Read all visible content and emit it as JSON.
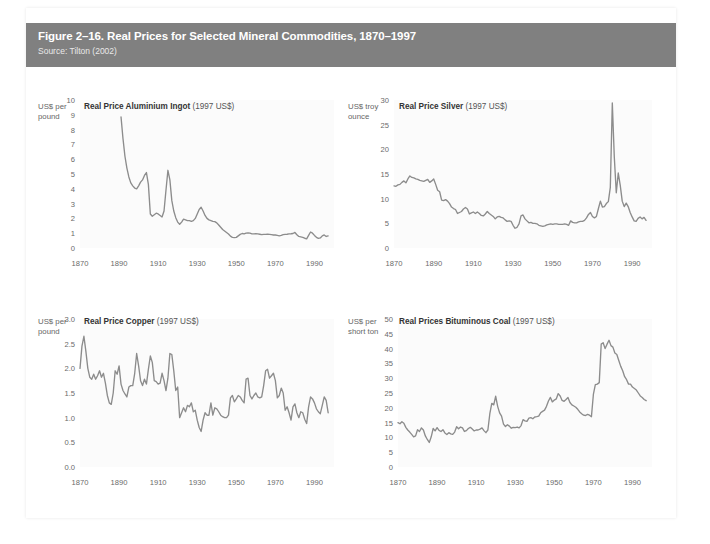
{
  "figure": {
    "title": "Figure 2–16. Real Prices for Selected Mineral Commodities, 1870–1997",
    "source": "Source: Tilton (2002)",
    "header_bg": "#808080",
    "header_text_color": "#ffffff",
    "line_color": "#8c8c8c",
    "plot_bg": "#fbfbfb"
  },
  "chart_data": [
    {
      "type": "line",
      "id": "aluminium",
      "title_bold": "Real Price Aluminium Ingot",
      "title_rest": " (1997 US$)",
      "unit_label": "US$ per\npound",
      "unit_line1": "US$ per",
      "unit_line2": "pound",
      "xlabel": "",
      "ylabel": "US$ per pound",
      "xlim": [
        1870,
        2000
      ],
      "ylim": [
        0,
        10
      ],
      "xticks": [
        1870,
        1890,
        1910,
        1930,
        1950,
        1970,
        1990
      ],
      "yticks": [
        0,
        1,
        2,
        3,
        4,
        5,
        6,
        7,
        8,
        9,
        10
      ],
      "grid": false,
      "legend": "none",
      "x": [
        1891,
        1892,
        1893,
        1894,
        1895,
        1896,
        1897,
        1898,
        1899,
        1900,
        1901,
        1902,
        1903,
        1904,
        1905,
        1906,
        1907,
        1908,
        1909,
        1910,
        1911,
        1912,
        1913,
        1914,
        1915,
        1916,
        1917,
        1918,
        1919,
        1920,
        1921,
        1922,
        1923,
        1924,
        1925,
        1926,
        1927,
        1928,
        1929,
        1930,
        1931,
        1932,
        1933,
        1934,
        1935,
        1936,
        1937,
        1938,
        1939,
        1940,
        1941,
        1942,
        1943,
        1944,
        1945,
        1946,
        1947,
        1948,
        1949,
        1950,
        1951,
        1952,
        1953,
        1954,
        1955,
        1956,
        1957,
        1958,
        1959,
        1960,
        1961,
        1962,
        1963,
        1964,
        1965,
        1966,
        1967,
        1968,
        1969,
        1970,
        1971,
        1972,
        1973,
        1974,
        1975,
        1976,
        1977,
        1978,
        1979,
        1980,
        1981,
        1982,
        1983,
        1984,
        1985,
        1986,
        1987,
        1988,
        1989,
        1990,
        1991,
        1992,
        1993,
        1994,
        1995,
        1996,
        1997
      ],
      "values": [
        8.85,
        7.4,
        6.2,
        5.4,
        4.8,
        4.4,
        4.2,
        4.05,
        4.0,
        4.2,
        4.45,
        4.6,
        4.9,
        5.1,
        4.3,
        2.3,
        2.15,
        2.25,
        2.35,
        2.3,
        2.2,
        2.1,
        2.5,
        3.9,
        5.25,
        4.6,
        3.2,
        2.5,
        2.05,
        1.75,
        1.6,
        1.75,
        1.95,
        1.9,
        1.85,
        1.85,
        1.8,
        1.85,
        2.0,
        2.3,
        2.6,
        2.75,
        2.5,
        2.2,
        2.0,
        1.9,
        1.85,
        1.8,
        1.78,
        1.7,
        1.55,
        1.4,
        1.25,
        1.15,
        1.05,
        0.95,
        0.8,
        0.72,
        0.7,
        0.72,
        0.82,
        0.92,
        0.98,
        0.95,
        1.0,
        1.02,
        1.0,
        0.95,
        0.95,
        0.96,
        0.95,
        0.93,
        0.9,
        0.92,
        0.92,
        0.93,
        0.92,
        0.9,
        0.88,
        0.88,
        0.85,
        0.82,
        0.85,
        0.9,
        0.92,
        0.93,
        0.95,
        0.96,
        0.98,
        1.05,
        0.9,
        0.78,
        0.75,
        0.72,
        0.66,
        0.62,
        0.85,
        1.08,
        1.0,
        0.85,
        0.72,
        0.65,
        0.68,
        0.82,
        0.88,
        0.78,
        0.82
      ]
    },
    {
      "type": "line",
      "id": "silver",
      "title_bold": "Real Price Silver",
      "title_rest": " (1997 US$)",
      "unit_line1": "US$ troy",
      "unit_line2": "ounce",
      "xlabel": "",
      "ylabel": "US$ troy ounce",
      "xlim": [
        1870,
        2000
      ],
      "ylim": [
        0,
        30
      ],
      "xticks": [
        1870,
        1890,
        1910,
        1930,
        1950,
        1970,
        1990
      ],
      "yticks": [
        0,
        5,
        10,
        15,
        20,
        25,
        30
      ],
      "grid": false,
      "legend": "none",
      "x": [
        1870,
        1871,
        1872,
        1873,
        1874,
        1875,
        1876,
        1877,
        1878,
        1879,
        1880,
        1881,
        1882,
        1883,
        1884,
        1885,
        1886,
        1887,
        1888,
        1889,
        1890,
        1891,
        1892,
        1893,
        1894,
        1895,
        1896,
        1897,
        1898,
        1899,
        1900,
        1901,
        1902,
        1903,
        1904,
        1905,
        1906,
        1907,
        1908,
        1909,
        1910,
        1911,
        1912,
        1913,
        1914,
        1915,
        1916,
        1917,
        1918,
        1919,
        1920,
        1921,
        1922,
        1923,
        1924,
        1925,
        1926,
        1927,
        1928,
        1929,
        1930,
        1931,
        1932,
        1933,
        1934,
        1935,
        1936,
        1937,
        1938,
        1939,
        1940,
        1941,
        1942,
        1943,
        1944,
        1945,
        1946,
        1947,
        1948,
        1949,
        1950,
        1951,
        1952,
        1953,
        1954,
        1955,
        1956,
        1957,
        1958,
        1959,
        1960,
        1961,
        1962,
        1963,
        1964,
        1965,
        1966,
        1967,
        1968,
        1969,
        1970,
        1971,
        1972,
        1973,
        1974,
        1975,
        1976,
        1977,
        1978,
        1979,
        1980,
        1981,
        1982,
        1983,
        1984,
        1985,
        1986,
        1987,
        1988,
        1989,
        1990,
        1991,
        1992,
        1993,
        1994,
        1995,
        1996,
        1997
      ],
      "values": [
        12.6,
        12.5,
        12.8,
        12.9,
        13.3,
        13.6,
        13.2,
        14.0,
        14.6,
        14.3,
        14.2,
        14.0,
        13.9,
        13.7,
        13.6,
        13.5,
        13.7,
        13.9,
        13.3,
        13.6,
        14.0,
        12.9,
        11.7,
        11.4,
        9.7,
        9.6,
        9.8,
        9.5,
        9.0,
        8.3,
        8.0,
        7.8,
        7.0,
        7.2,
        7.4,
        7.9,
        8.2,
        7.9,
        6.9,
        7.1,
        7.3,
        7.0,
        7.3,
        7.0,
        6.6,
        6.5,
        6.9,
        7.4,
        7.0,
        6.7,
        6.4,
        5.9,
        6.3,
        6.4,
        6.2,
        6.1,
        5.7,
        5.4,
        5.5,
        5.4,
        4.6,
        4.0,
        4.2,
        4.9,
        6.5,
        6.7,
        5.9,
        5.5,
        5.1,
        5.2,
        5.0,
        5.0,
        4.9,
        4.6,
        4.5,
        4.4,
        4.5,
        4.7,
        4.8,
        4.9,
        4.8,
        4.9,
        4.9,
        4.8,
        4.8,
        4.8,
        4.9,
        4.8,
        4.6,
        5.5,
        5.2,
        5.1,
        5.1,
        5.3,
        5.4,
        5.4,
        5.6,
        6.1,
        6.8,
        7.2,
        6.4,
        6.1,
        6.4,
        8.0,
        9.5,
        8.3,
        8.4,
        9.0,
        9.4,
        12.3,
        29.4,
        18.5,
        11.2,
        15.2,
        12.7,
        9.5,
        8.4,
        9.1,
        8.4,
        7.2,
        6.3,
        5.5,
        5.4,
        6.0,
        6.3,
        5.9,
        6.2,
        5.6
      ]
    },
    {
      "type": "line",
      "id": "copper",
      "title_bold": "Real Price Copper",
      "title_rest": " (1997 US$)",
      "unit_line1": "US$ per",
      "unit_line2": "pound",
      "xlabel": "",
      "ylabel": "US$ per pound",
      "xlim": [
        1870,
        2000
      ],
      "ylim": [
        0,
        3.0
      ],
      "xticks": [
        1870,
        1890,
        1910,
        1930,
        1950,
        1970,
        1990
      ],
      "yticks": [
        0.0,
        0.5,
        1.0,
        1.5,
        2.0,
        2.5,
        3.0
      ],
      "ytick_labels": [
        "0.0",
        "0.5",
        "1.0",
        "1.5",
        "2.0",
        "2.5",
        "3.0"
      ],
      "grid": false,
      "legend": "none",
      "x": [
        1870,
        1871,
        1872,
        1873,
        1874,
        1875,
        1876,
        1877,
        1878,
        1879,
        1880,
        1881,
        1882,
        1883,
        1884,
        1885,
        1886,
        1887,
        1888,
        1889,
        1890,
        1891,
        1892,
        1893,
        1894,
        1895,
        1896,
        1897,
        1898,
        1899,
        1900,
        1901,
        1902,
        1903,
        1904,
        1905,
        1906,
        1907,
        1908,
        1909,
        1910,
        1911,
        1912,
        1913,
        1914,
        1915,
        1916,
        1917,
        1918,
        1919,
        1920,
        1921,
        1922,
        1923,
        1924,
        1925,
        1926,
        1927,
        1928,
        1929,
        1930,
        1931,
        1932,
        1933,
        1934,
        1935,
        1936,
        1937,
        1938,
        1939,
        1940,
        1941,
        1942,
        1943,
        1944,
        1945,
        1946,
        1947,
        1948,
        1949,
        1950,
        1951,
        1952,
        1953,
        1954,
        1955,
        1956,
        1957,
        1958,
        1959,
        1960,
        1961,
        1962,
        1963,
        1964,
        1965,
        1966,
        1967,
        1968,
        1969,
        1970,
        1971,
        1972,
        1973,
        1974,
        1975,
        1976,
        1977,
        1978,
        1979,
        1980,
        1981,
        1982,
        1983,
        1984,
        1985,
        1986,
        1987,
        1988,
        1989,
        1990,
        1991,
        1992,
        1993,
        1994,
        1995,
        1996,
        1997
      ],
      "values": [
        2.0,
        2.45,
        2.65,
        2.35,
        2.0,
        1.82,
        1.78,
        1.88,
        1.78,
        1.85,
        1.95,
        1.82,
        1.9,
        1.7,
        1.45,
        1.3,
        1.27,
        1.5,
        1.95,
        1.88,
        2.05,
        1.68,
        1.55,
        1.48,
        1.42,
        1.62,
        1.65,
        1.65,
        1.9,
        2.3,
        2.05,
        1.75,
        1.65,
        1.78,
        1.68,
        1.98,
        2.25,
        2.12,
        1.75,
        1.73,
        1.68,
        1.7,
        1.9,
        1.75,
        1.55,
        1.8,
        2.3,
        2.28,
        1.95,
        1.55,
        1.62,
        1.0,
        1.1,
        1.2,
        1.12,
        1.25,
        1.22,
        1.3,
        1.12,
        1.15,
        0.95,
        0.8,
        0.72,
        0.95,
        1.1,
        1.05,
        1.05,
        1.3,
        1.05,
        1.2,
        1.18,
        1.12,
        1.05,
        1.02,
        1.0,
        1.0,
        1.05,
        1.4,
        1.45,
        1.32,
        1.38,
        1.45,
        1.42,
        1.35,
        1.3,
        1.78,
        1.8,
        1.45,
        1.38,
        1.45,
        1.5,
        1.42,
        1.4,
        1.42,
        1.65,
        1.95,
        1.98,
        1.8,
        1.85,
        1.9,
        1.75,
        1.4,
        1.45,
        1.6,
        1.5,
        1.15,
        1.22,
        1.1,
        0.95,
        1.22,
        1.28,
        1.1,
        1.0,
        1.12,
        1.1,
        0.97,
        0.88,
        1.22,
        1.42,
        1.38,
        1.3,
        1.18,
        1.12,
        1.08,
        1.25,
        1.42,
        1.35,
        1.1
      ]
    },
    {
      "type": "line",
      "id": "coal",
      "title_bold": "Real Prices Bituminous Coal",
      "title_rest": " (1997 US$)",
      "unit_line1": "US$ per",
      "unit_line2": "short ton",
      "xlabel": "",
      "ylabel": "US$ per short ton",
      "xlim": [
        1870,
        2000
      ],
      "ylim": [
        0,
        50
      ],
      "xticks": [
        1870,
        1890,
        1910,
        1930,
        1950,
        1970,
        1990
      ],
      "yticks": [
        0,
        5,
        10,
        15,
        20,
        25,
        30,
        35,
        40,
        45,
        50
      ],
      "grid": false,
      "legend": "none",
      "x": [
        1870,
        1871,
        1872,
        1873,
        1874,
        1875,
        1876,
        1877,
        1878,
        1879,
        1880,
        1881,
        1882,
        1883,
        1884,
        1885,
        1886,
        1887,
        1888,
        1889,
        1890,
        1891,
        1892,
        1893,
        1894,
        1895,
        1896,
        1897,
        1898,
        1899,
        1900,
        1901,
        1902,
        1903,
        1904,
        1905,
        1906,
        1907,
        1908,
        1909,
        1910,
        1911,
        1912,
        1913,
        1914,
        1915,
        1916,
        1917,
        1918,
        1919,
        1920,
        1921,
        1922,
        1923,
        1924,
        1925,
        1926,
        1927,
        1928,
        1929,
        1930,
        1931,
        1932,
        1933,
        1934,
        1935,
        1936,
        1937,
        1938,
        1939,
        1940,
        1941,
        1942,
        1943,
        1944,
        1945,
        1946,
        1947,
        1948,
        1949,
        1950,
        1951,
        1952,
        1953,
        1954,
        1955,
        1956,
        1957,
        1958,
        1959,
        1960,
        1961,
        1962,
        1963,
        1964,
        1965,
        1966,
        1967,
        1968,
        1969,
        1970,
        1971,
        1972,
        1973,
        1974,
        1975,
        1976,
        1977,
        1978,
        1979,
        1980,
        1981,
        1982,
        1983,
        1984,
        1985,
        1986,
        1987,
        1988,
        1989,
        1990,
        1991,
        1992,
        1993,
        1994,
        1995,
        1996,
        1997
      ],
      "values": [
        15.0,
        14.6,
        15.3,
        14.8,
        13.4,
        12.5,
        11.8,
        11.0,
        10.2,
        10.5,
        12.6,
        12.0,
        13.2,
        12.5,
        10.5,
        9.3,
        8.3,
        10.2,
        13.0,
        12.2,
        13.3,
        12.4,
        12.0,
        12.6,
        11.5,
        11.0,
        11.6,
        11.2,
        11.0,
        11.8,
        13.6,
        12.9,
        13.5,
        13.2,
        12.0,
        12.3,
        13.0,
        13.4,
        12.8,
        12.2,
        12.5,
        12.5,
        12.8,
        13.2,
        12.3,
        11.6,
        12.5,
        18.0,
        21.5,
        21.0,
        23.9,
        20.5,
        18.3,
        17.2,
        14.5,
        13.7,
        14.3,
        13.8,
        13.1,
        13.4,
        13.3,
        13.5,
        13.2,
        14.0,
        16.0,
        15.6,
        15.4,
        16.5,
        16.7,
        16.3,
        16.9,
        17.0,
        17.2,
        18.3,
        18.8,
        19.2,
        20.5,
        22.3,
        23.5,
        22.0,
        22.6,
        23.0,
        24.8,
        24.0,
        22.5,
        22.2,
        22.8,
        23.5,
        21.8,
        21.0,
        20.6,
        20.2,
        19.5,
        18.6,
        18.0,
        17.5,
        17.4,
        17.8,
        17.5,
        17.0,
        24.5,
        27.8,
        28.0,
        28.5,
        41.5,
        42.0,
        40.0,
        41.5,
        42.8,
        41.0,
        40.5,
        38.5,
        38.0,
        36.0,
        34.0,
        32.5,
        30.5,
        29.5,
        28.0,
        28.0,
        27.0,
        26.5,
        26.0,
        25.0,
        24.0,
        23.5,
        22.8,
        22.4
      ]
    }
  ]
}
